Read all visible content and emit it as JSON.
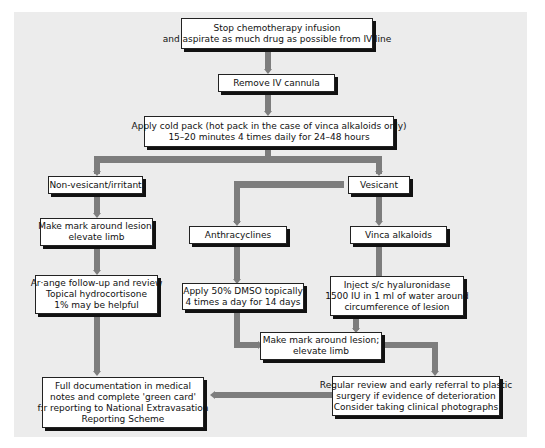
{
  "colors": {
    "panel": "#ececec",
    "connector": "#7d7d7d",
    "box_border": "#222222",
    "box_bg": "#ffffff"
  },
  "nodes": {
    "stop_infusion": {
      "lines": [
        "Stop chemotherapy infusion",
        "and aspirate as much drug as possible from IV line"
      ]
    },
    "remove_cannula": {
      "lines": [
        "Remove IV cannula"
      ]
    },
    "cold_pack": {
      "lines": [
        "Apply cold pack (hot pack in the case of vinca alkaloids only)",
        "15–20 minutes 4 times daily for 24–48 hours"
      ]
    },
    "non_vesicant": {
      "lines": [
        "Non-vesicant/irritant"
      ]
    },
    "vesicant": {
      "lines": [
        "Vesicant"
      ]
    },
    "mark_left": {
      "lines": [
        "Make mark around lesion;",
        "elevate limb"
      ]
    },
    "anthracyclines": {
      "lines": [
        "Anthracyclines"
      ]
    },
    "vinca": {
      "lines": [
        "Vinca alkaloids"
      ]
    },
    "follow_up": {
      "lines": [
        "Ar·ange follow-up and review",
        "Topical hydrocortisone",
        "1% may be helpful"
      ]
    },
    "dmso": {
      "lines": [
        "Apply 50% DMSO topically",
        "4 times a day for 14 days"
      ]
    },
    "hyaluronidase": {
      "lines": [
        "Inject s/c hyaluronidase",
        "1500 IU in 1 ml of water around",
        "circumference of lesion"
      ]
    },
    "mark_center": {
      "lines": [
        "Make mark around lesion;",
        "elevate limb"
      ]
    },
    "documentation": {
      "lines": [
        "Full documentation in medical",
        "notes and complete 'green card'",
        "f:r reporting to National Extravasation",
        "Reporting Scheme"
      ]
    },
    "regular_review": {
      "lines": [
        "Regular review and early referral to plastic",
        "surgery if evidence of deterioration",
        "Consider taking clinical photographs"
      ]
    }
  }
}
